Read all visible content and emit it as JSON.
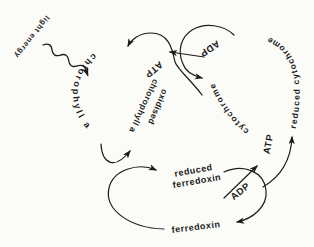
{
  "diagram": {
    "colors": {
      "ink": "#1b1b1b",
      "background": "#fbfbf8"
    },
    "labels": {
      "light_energy": "light energy",
      "chlorophyll_a": "chlorophyll a",
      "oxidised_line1": "oxidised",
      "oxidised_line2": "chlorophyll a",
      "atp_top": "ATP",
      "adp_top": "ADP",
      "reduced_cytochrome": "reduced cytochrome",
      "cytochrome": "cytochrome",
      "atp_right": "ATP",
      "adp_bottom": "ADP",
      "reduced_ferredoxin_line1": "reduced",
      "reduced_ferredoxin_line2": "ferredoxin",
      "ferredoxin": "ferredoxin"
    }
  }
}
